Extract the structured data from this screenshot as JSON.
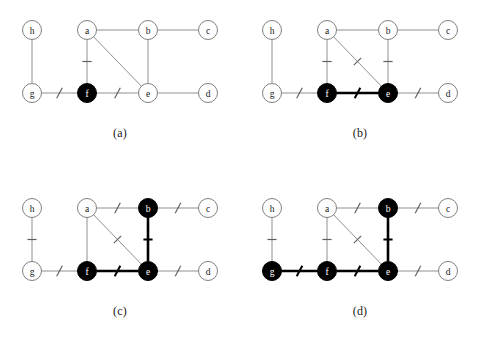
{
  "figure": {
    "width": 480,
    "height": 356,
    "background": "#ffffff",
    "style": {
      "node_radius": 9.5,
      "node_fill_empty": "#ffffff",
      "node_fill_filled": "#000000",
      "node_stroke": "#808080",
      "node_stroke_filled": "#000000",
      "node_label_color_on_empty": "#1a1a1a",
      "node_label_color_on_filled": "#ffffff",
      "edge_color_thin": "#909090",
      "edge_color_thick": "#000000",
      "edge_width_thin": 1,
      "edge_width_thick": 2.6,
      "tick_color": "#606060",
      "tick_color_on_thick": "#000000"
    },
    "nodes": [
      {
        "id": "h",
        "label": "h",
        "x": 32,
        "y": 30
      },
      {
        "id": "a",
        "label": "a",
        "x": 87,
        "y": 30
      },
      {
        "id": "b",
        "label": "b",
        "x": 148,
        "y": 30
      },
      {
        "id": "c",
        "label": "c",
        "x": 208,
        "y": 30
      },
      {
        "id": "g",
        "label": "g",
        "x": 32,
        "y": 93
      },
      {
        "id": "f",
        "label": "f",
        "x": 87,
        "y": 93
      },
      {
        "id": "e",
        "label": "e",
        "x": 148,
        "y": 93
      },
      {
        "id": "d",
        "label": "d",
        "x": 208,
        "y": 93
      }
    ],
    "edges": [
      {
        "id": "h-g",
        "from": "h",
        "to": "g"
      },
      {
        "id": "a-b",
        "from": "a",
        "to": "b"
      },
      {
        "id": "b-c",
        "from": "b",
        "to": "c"
      },
      {
        "id": "a-f",
        "from": "a",
        "to": "f"
      },
      {
        "id": "a-e",
        "from": "a",
        "to": "e"
      },
      {
        "id": "b-e",
        "from": "b",
        "to": "e"
      },
      {
        "id": "g-f",
        "from": "g",
        "to": "f"
      },
      {
        "id": "f-e",
        "from": "f",
        "to": "e"
      },
      {
        "id": "e-d",
        "from": "e",
        "to": "d"
      }
    ],
    "panels": [
      {
        "key": "a",
        "caption": "(a)",
        "origin": {
          "x": 0,
          "y": 0
        },
        "filled_nodes": [
          "f"
        ],
        "thick_edges": [],
        "ticked_edges": [
          "a-f",
          "g-f",
          "f-e"
        ]
      },
      {
        "key": "b",
        "caption": "(b)",
        "origin": {
          "x": 240,
          "y": 0
        },
        "filled_nodes": [
          "f",
          "e"
        ],
        "thick_edges": [
          "f-e"
        ],
        "ticked_edges": [
          "a-f",
          "a-e",
          "b-e",
          "g-f",
          "f-e",
          "e-d"
        ]
      },
      {
        "key": "c",
        "caption": "(c)",
        "origin": {
          "x": 0,
          "y": 178
        },
        "filled_nodes": [
          "b",
          "f",
          "e"
        ],
        "thick_edges": [
          "f-e",
          "b-e"
        ],
        "ticked_edges": [
          "h-g",
          "a-b",
          "b-c",
          "a-e",
          "b-e",
          "g-f",
          "f-e",
          "e-d"
        ]
      },
      {
        "key": "d",
        "caption": "(d)",
        "origin": {
          "x": 240,
          "y": 178
        },
        "filled_nodes": [
          "g",
          "b",
          "f",
          "e"
        ],
        "thick_edges": [
          "g-f",
          "f-e",
          "b-e"
        ],
        "ticked_edges": [
          "h-g",
          "a-f",
          "a-b",
          "b-c",
          "a-e",
          "b-e",
          "g-f",
          "f-e",
          "e-d"
        ]
      }
    ]
  }
}
